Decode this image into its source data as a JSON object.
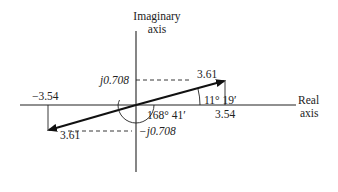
{
  "diagram": {
    "type": "complex-plane-phasor",
    "vertical_axis_label_line1": "Imaginary",
    "vertical_axis_label_line2": "axis",
    "horizontal_axis_label_line1": "Real",
    "horizontal_axis_label_line2": "axis",
    "phasor_positive": {
      "magnitude_label": "3.61",
      "real_label": "3.54",
      "imag_label": "j0.708",
      "angle_label": "11° 19′"
    },
    "phasor_negative": {
      "magnitude_label": "3.61",
      "real_label": "−3.54",
      "imag_label": "−j0.708",
      "angle_label": "168° 41′"
    }
  }
}
